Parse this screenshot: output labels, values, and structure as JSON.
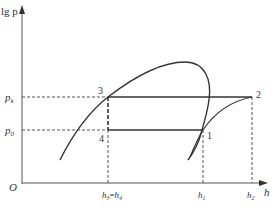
{
  "diagram": {
    "type": "lg p-h refrigeration cycle diagram",
    "axes": {
      "y_label": "lg p",
      "x_label": "h",
      "origin_label": "O"
    },
    "pressure_levels": {
      "high": "p_k",
      "low": "p_0"
    },
    "pressure_labels": {
      "high_base": "p",
      "high_sub": "k",
      "low_base": "p",
      "low_sub": "0"
    },
    "points": [
      {
        "id": "1",
        "label": "1"
      },
      {
        "id": "2",
        "label": "2"
      },
      {
        "id": "3",
        "label": "3"
      },
      {
        "id": "4",
        "label": "4"
      }
    ],
    "enthalpy_ticks": {
      "h34_a_base": "h",
      "h34_a_sub": "3",
      "h34_eq": "=",
      "h34_b_base": "h",
      "h34_b_sub": "4",
      "h1_base": "h",
      "h1_sub": "1",
      "h2_base": "h",
      "h2_sub": "2"
    },
    "colors": {
      "line": "#333333",
      "dashed": "#444444"
    }
  }
}
